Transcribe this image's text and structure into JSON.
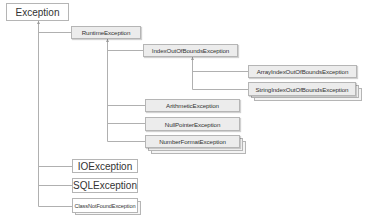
{
  "diagram": {
    "type": "class-hierarchy",
    "root": {
      "label": "Exception",
      "children": [
        {
          "label": "RuntimeException",
          "children": [
            {
              "label": "IndexOutOfBoundsException",
              "children": [
                {
                  "label": "ArrayIndexOutOfBoundsException"
                },
                {
                  "label": "StringIndexOutOfBoundsException",
                  "stacked": true
                }
              ]
            },
            {
              "label": "ArithmeticException"
            },
            {
              "label": "NullPointerException"
            },
            {
              "label": "NumberFormatException",
              "stacked": true
            }
          ]
        },
        {
          "label": "IOException"
        },
        {
          "label": "SQLException"
        },
        {
          "label": "ClassNotFoundException",
          "stacked": true
        }
      ]
    }
  },
  "nodes": {
    "exception": "Exception",
    "runtime": "RuntimeException",
    "index_oob": "IndexOutOfBoundsException",
    "array_index_oob": "ArrayIndexOutOfBoundsException",
    "string_index_oob": "StringIndexOutOfBoundsException",
    "arithmetic": "ArithmeticException",
    "null_pointer": "NullPointerException",
    "number_format": "NumberFormatException",
    "io": "IOException",
    "sql": "SQLException",
    "class_not_found": "ClassNotFoundException"
  },
  "colors": {
    "line": "#b0b0b0",
    "border": "#b5b5b5",
    "gray_fill": "#ececec",
    "white_fill": "#ffffff",
    "text": "#333333"
  }
}
